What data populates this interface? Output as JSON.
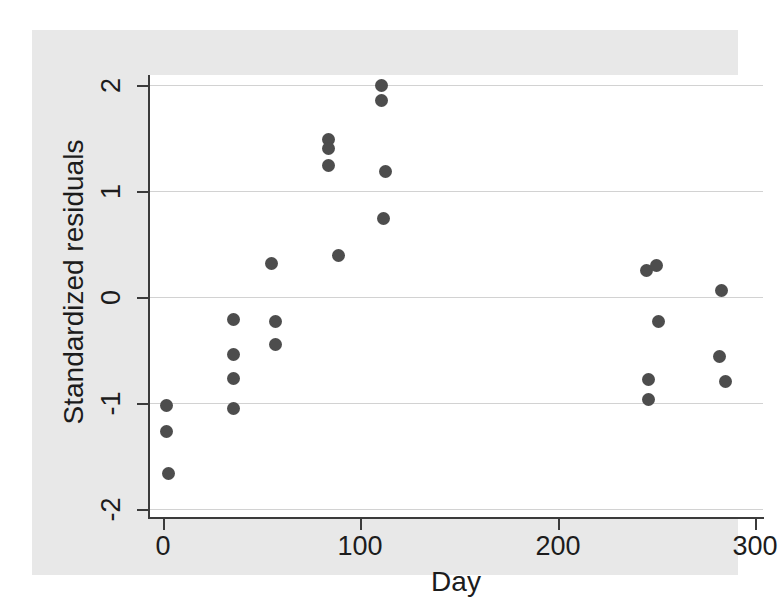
{
  "chart_data": {
    "type": "scatter",
    "title": "",
    "xlabel": "Day",
    "ylabel": "Standardized residuals",
    "xlim": [
      -7,
      304
    ],
    "ylim": [
      -2.08,
      2.09
    ],
    "xticks": [
      0,
      100,
      200,
      300
    ],
    "xtick_labels": [
      "0",
      "100",
      "200",
      "300"
    ],
    "yticks": [
      2,
      1,
      0,
      -1,
      -2
    ],
    "ytick_labels": [
      "2",
      "1",
      "0",
      "-1",
      "-2"
    ],
    "grid": "horizontal-dashed",
    "legend": "none",
    "marker": "filled-circle",
    "marker_color": "#4d4d4d",
    "points": [
      {
        "x": 2,
        "y": -1.03
      },
      {
        "x": 2,
        "y": -1.27
      },
      {
        "x": 3,
        "y": -1.67
      },
      {
        "x": 36,
        "y": -0.22
      },
      {
        "x": 36,
        "y": -0.55
      },
      {
        "x": 36,
        "y": -0.77
      },
      {
        "x": 36,
        "y": -1.06
      },
      {
        "x": 55,
        "y": 0.31
      },
      {
        "x": 57,
        "y": -0.24
      },
      {
        "x": 57,
        "y": -0.45
      },
      {
        "x": 84,
        "y": 1.48
      },
      {
        "x": 84,
        "y": 1.4
      },
      {
        "x": 84,
        "y": 1.24
      },
      {
        "x": 89,
        "y": 0.39
      },
      {
        "x": 111,
        "y": 1.99
      },
      {
        "x": 111,
        "y": 1.85
      },
      {
        "x": 113,
        "y": 1.18
      },
      {
        "x": 112,
        "y": 0.74
      },
      {
        "x": 245,
        "y": 0.25
      },
      {
        "x": 250,
        "y": 0.29
      },
      {
        "x": 251,
        "y": -0.24
      },
      {
        "x": 246,
        "y": -0.78
      },
      {
        "x": 246,
        "y": -0.97
      },
      {
        "x": 283,
        "y": 0.06
      },
      {
        "x": 282,
        "y": -0.57
      },
      {
        "x": 285,
        "y": -0.8
      }
    ]
  },
  "colors": {
    "figure_background": "#e8e8e8",
    "plot_background": "#ffffff",
    "axis": "#3b3b3b",
    "gridline": "#d2d2d2",
    "marker": "#4d4d4d",
    "text": "#1c1c1c"
  }
}
